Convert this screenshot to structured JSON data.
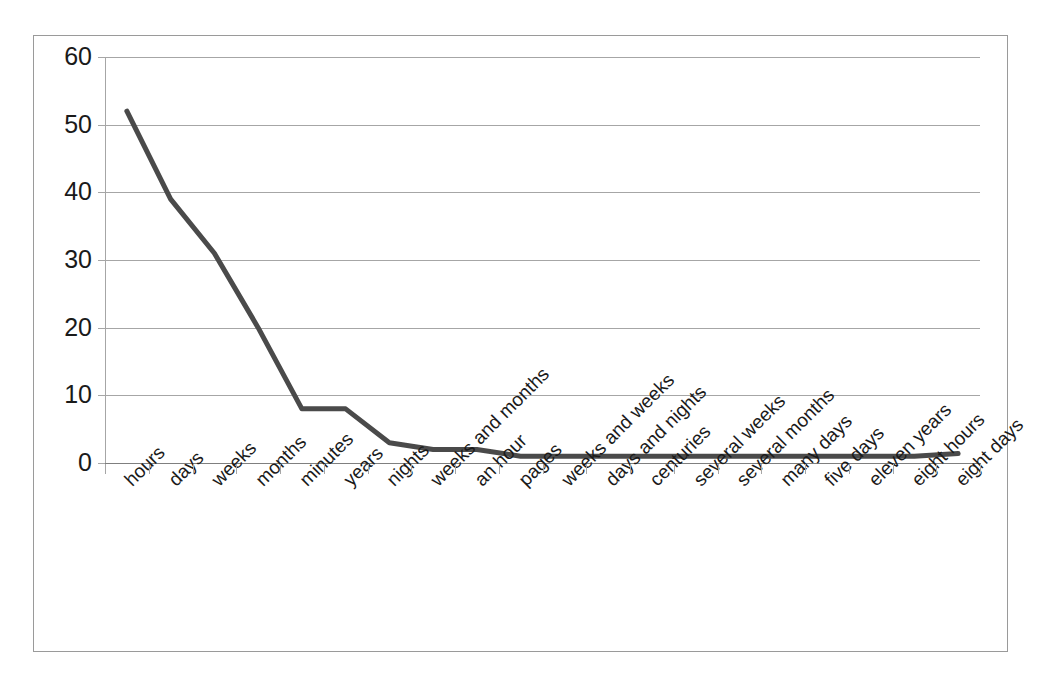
{
  "chart_data": {
    "type": "line",
    "title": "",
    "subtitle": "",
    "xlabel": "",
    "ylabel": "",
    "ylim": [
      0,
      60
    ],
    "ytick_labels": [
      "60",
      "50",
      "40",
      "30",
      "20",
      "10",
      "0"
    ],
    "yticks": [
      60,
      50,
      40,
      30,
      20,
      10,
      0
    ],
    "grid": true,
    "legend": false,
    "legend_position": "none",
    "line_color": "#4a4a4a",
    "gridline_color": "#a6a6a6",
    "background_color": "#ffffff",
    "categories": [
      "hours",
      "days",
      "weeks",
      "months",
      "minutes",
      "years",
      "nights",
      "weeks and months",
      "an hour",
      "pages",
      "weeks and weeks",
      "days and nights",
      "centuries",
      "several weeks",
      "several months",
      "many days",
      "five days",
      "eleven years",
      "eight hours",
      "eight days"
    ],
    "values": [
      52,
      39,
      31,
      20,
      8,
      8,
      3,
      2,
      2,
      1,
      1,
      1,
      1,
      1,
      1,
      1,
      1,
      1,
      1,
      1.4
    ]
  }
}
